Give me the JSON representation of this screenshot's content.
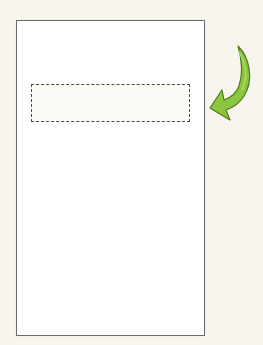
{
  "diagram": {
    "page": {
      "shape": "rectangle",
      "fill": "#ffffff",
      "border": "#6b6b6b"
    },
    "placeholder": {
      "style": "dashed",
      "border": "#4a4a4a",
      "fill": "#fbfaf5"
    },
    "arrow": {
      "icon": "curved-arrow-icon",
      "direction": "down-left",
      "fill": "#8cc63f",
      "outline": "#4e7a1c"
    },
    "background": "#f7f5ee"
  }
}
